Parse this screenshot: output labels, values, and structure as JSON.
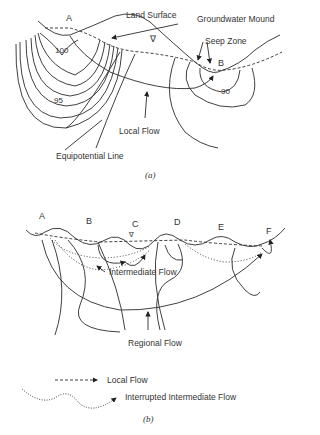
{
  "figure_a": {
    "caption": "(a)",
    "point_labels": [
      "A",
      "B"
    ],
    "contour_labels": [
      "100",
      "95",
      "90"
    ],
    "annotations": {
      "land_surface": "Land Surface",
      "groundwater_mound": "Groundwater Mound",
      "seep_zone": "Seep Zone",
      "local_flow": "Local Flow",
      "equipotential_line": "Equipotential Line",
      "water_table_symbol": "∇"
    }
  },
  "figure_b": {
    "caption": "(b)",
    "point_labels": [
      "A",
      "B",
      "C",
      "D",
      "E",
      "F"
    ],
    "annotations": {
      "intermediate_flow": "Intermediate Flow",
      "regional_flow": "Regional Flow",
      "water_table_symbol": "∇"
    },
    "legend": [
      {
        "style": "dashed",
        "label": "Local Flow"
      },
      {
        "style": "dotted",
        "label": "Interrupted Intermediate Flow"
      }
    ]
  },
  "colors": {
    "line": "#2a2a2a",
    "background": "#ffffff"
  }
}
